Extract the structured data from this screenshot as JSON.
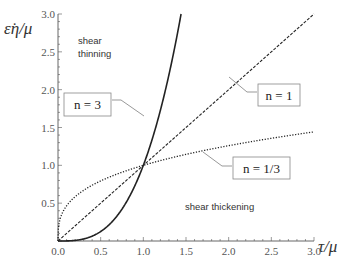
{
  "chart_data": {
    "type": "line",
    "title": "",
    "xlabel": "τ/μ",
    "ylabel": "ε̇η/μ",
    "xlim": [
      0,
      3.0
    ],
    "ylim": [
      0,
      3.0
    ],
    "grid": false,
    "x_ticks": [
      "0.0",
      "0.5",
      "1.0",
      "1.5",
      "2.0",
      "2.5",
      "3.0"
    ],
    "y_ticks": [
      "0.5",
      "1.0",
      "1.5",
      "2.0",
      "2.5",
      "3.0"
    ],
    "series": [
      {
        "name": "n = 3",
        "style": "solid",
        "formula": "y = x^3",
        "x": [
          0,
          0.25,
          0.5,
          0.75,
          1.0,
          1.25,
          1.44
        ],
        "y": [
          0,
          0.016,
          0.125,
          0.42,
          1.0,
          1.95,
          3.0
        ]
      },
      {
        "name": "n = 1",
        "style": "dashed",
        "formula": "y = x",
        "x": [
          0,
          1.0,
          2.0,
          3.0
        ],
        "y": [
          0,
          1.0,
          2.0,
          3.0
        ]
      },
      {
        "name": "n = 1/3",
        "style": "dotted",
        "formula": "y = x^(1/3)",
        "x": [
          0,
          0.125,
          0.5,
          1.0,
          2.0,
          3.0
        ],
        "y": [
          0,
          0.5,
          0.79,
          1.0,
          1.26,
          1.44
        ]
      }
    ],
    "annotations": [
      {
        "text": "shear thinning",
        "x": 0.25,
        "y": 2.55
      },
      {
        "text": "shear thickening",
        "x": 1.3,
        "y": 0.5
      },
      {
        "text": "n = 3",
        "box": true,
        "points_to": "solid"
      },
      {
        "text": "n = 1",
        "box": true,
        "points_to": "dashed"
      },
      {
        "text": "n = 1/3",
        "box": true,
        "points_to": "dotted"
      }
    ]
  },
  "labels": {
    "ylabel": "ε̇η/μ",
    "xlabel": "τ/μ",
    "shear_thinning_1": "shear",
    "shear_thinning_2": "thinning",
    "shear_thickening": "shear thickening",
    "legend_n3": "n = 3",
    "legend_n1": "n = 1",
    "legend_n13": "n = 1/3"
  },
  "colors": {
    "axis": "#555555",
    "curve": "#222222",
    "leader": "#999999",
    "box_border": "#888888"
  }
}
